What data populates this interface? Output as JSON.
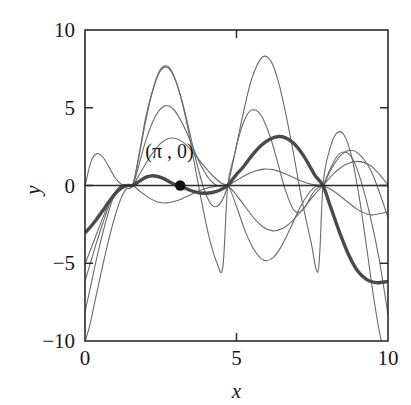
{
  "chart_data": {
    "type": "line",
    "title": "",
    "xlabel": "x",
    "ylabel": "y",
    "xlim": [
      0,
      10
    ],
    "ylim": [
      -10,
      10
    ],
    "grid": false,
    "legend": false,
    "xticks": [
      0,
      5,
      10
    ],
    "xticklabels": [
      "0",
      "5",
      "10"
    ],
    "yticks": [
      -10,
      -5,
      0,
      5,
      10
    ],
    "yticklabels": [
      "−10",
      "−5",
      "0",
      "5",
      "10"
    ],
    "common_nodes_x": [
      1.571,
      4.712,
      7.854
    ],
    "annotations": [
      {
        "text": "(π , 0)",
        "x": 3.1416,
        "y": 0,
        "marker": "filled-circle",
        "label_offset_x": -0.35,
        "label_offset_y": 1.75
      }
    ],
    "series": [
      {
        "name": "curve-1",
        "emphasis": "bold",
        "color": "#4a4a4a",
        "x": [
          0.0,
          0.2,
          0.4,
          0.6,
          0.8,
          1.0,
          1.2,
          1.4,
          1.571,
          1.8,
          2.0,
          2.2,
          2.4,
          2.6,
          2.8,
          3.0,
          3.1416,
          3.4,
          3.6,
          3.8,
          4.0,
          4.2,
          4.4,
          4.6,
          4.712,
          5.0,
          5.2,
          5.5,
          5.8,
          6.1,
          6.4,
          6.6,
          6.8,
          7.0,
          7.2,
          7.4,
          7.6,
          7.854,
          8.1,
          8.4,
          8.7,
          9.0,
          9.3,
          9.6,
          9.8,
          10.0
        ],
        "y": [
          -3.05,
          -2.62,
          -2.12,
          -1.58,
          -1.02,
          -0.52,
          -0.16,
          -0.01,
          0.0,
          0.28,
          0.52,
          0.62,
          0.58,
          0.44,
          0.22,
          0.04,
          -0.03,
          -0.26,
          -0.4,
          -0.48,
          -0.5,
          -0.45,
          -0.34,
          -0.14,
          0.0,
          0.72,
          1.14,
          1.9,
          2.55,
          2.98,
          3.15,
          3.08,
          2.85,
          2.48,
          1.95,
          1.3,
          0.62,
          0.0,
          -1.35,
          -3.0,
          -4.45,
          -5.5,
          -6.05,
          -6.25,
          -6.22,
          -6.18
        ]
      },
      {
        "name": "curve-2",
        "emphasis": "normal",
        "color": "#6b6b6b",
        "x": [
          0.0,
          0.2,
          0.4,
          0.6,
          0.8,
          1.0,
          1.2,
          1.4,
          1.571,
          1.8,
          2.1,
          2.4,
          2.7,
          3.0,
          3.3,
          3.6,
          3.9,
          4.2,
          4.5,
          4.712,
          5.0,
          5.3,
          5.6,
          5.9,
          6.2,
          6.5,
          6.8,
          7.1,
          7.4,
          7.6,
          7.854,
          8.2,
          8.6,
          9.0,
          9.4,
          9.7,
          10.0
        ],
        "y": [
          -0.05,
          1.55,
          2.05,
          1.8,
          1.15,
          0.48,
          0.08,
          -0.02,
          0.0,
          -0.35,
          -0.78,
          -1.06,
          -1.12,
          -1.0,
          -0.76,
          -0.48,
          -0.24,
          -0.09,
          -0.02,
          0.0,
          0.32,
          0.66,
          0.92,
          1.05,
          1.02,
          0.84,
          0.58,
          0.32,
          0.11,
          0.04,
          0.0,
          -0.35,
          -0.95,
          -1.55,
          -1.88,
          -1.82,
          -1.7
        ]
      },
      {
        "name": "curve-3",
        "emphasis": "normal",
        "color": "#6b6b6b",
        "x": [
          0.0,
          0.2,
          0.4,
          0.6,
          0.8,
          1.0,
          1.2,
          1.4,
          1.571,
          1.8,
          2.1,
          2.4,
          2.7,
          3.0,
          3.3,
          3.6,
          3.9,
          4.2,
          4.5,
          4.712,
          5.0,
          5.3,
          5.6,
          5.9,
          6.2,
          6.5,
          6.8,
          7.1,
          7.4,
          7.6,
          7.854,
          8.2,
          8.6,
          9.0,
          9.4,
          9.7,
          10.0
        ],
        "y": [
          -5.05,
          -4.05,
          -3.02,
          -2.02,
          -1.1,
          -0.4,
          -0.02,
          0.05,
          0.0,
          0.72,
          1.7,
          2.52,
          2.98,
          3.02,
          2.68,
          2.05,
          1.32,
          0.66,
          0.15,
          0.0,
          -0.62,
          -1.4,
          -2.15,
          -2.7,
          -2.92,
          -2.78,
          -2.35,
          -1.72,
          -1.0,
          -0.52,
          0.0,
          0.75,
          1.35,
          1.55,
          1.3,
          0.75,
          0.05
        ]
      },
      {
        "name": "curve-4",
        "emphasis": "normal",
        "color": "#6b6b6b",
        "x": [
          0.0,
          0.2,
          0.4,
          0.6,
          0.8,
          1.0,
          1.2,
          1.4,
          1.571,
          1.75,
          2.0,
          2.3,
          2.6,
          2.9,
          3.2,
          3.5,
          3.8,
          4.1,
          4.4,
          4.712,
          5.0,
          5.3,
          5.6,
          5.9,
          6.2,
          6.5,
          6.8,
          7.1,
          7.4,
          7.6,
          7.854,
          8.1,
          8.4,
          8.7,
          9.0,
          9.4,
          9.7,
          10.0
        ],
        "y": [
          -6.15,
          -4.85,
          -3.55,
          -2.35,
          -1.25,
          -0.42,
          -0.02,
          0.06,
          0.0,
          1.1,
          2.85,
          4.35,
          5.1,
          4.95,
          4.05,
          2.75,
          1.4,
          0.42,
          -0.05,
          0.0,
          -1.35,
          -3.0,
          -4.2,
          -4.8,
          -4.65,
          -3.85,
          -2.65,
          -1.4,
          -0.45,
          -0.08,
          0.0,
          0.95,
          1.85,
          2.25,
          2.1,
          1.1,
          -0.35,
          -2.05
        ]
      },
      {
        "name": "curve-5",
        "emphasis": "normal",
        "color": "#6b6b6b",
        "x": [
          0.0,
          0.2,
          0.4,
          0.6,
          0.8,
          1.0,
          1.2,
          1.4,
          1.571,
          1.75,
          2.0,
          2.2,
          2.45,
          2.7,
          2.95,
          3.2,
          3.45,
          3.7,
          3.95,
          4.2,
          4.45,
          4.712,
          5.0,
          5.25,
          5.5,
          5.8,
          6.1,
          6.35,
          6.6,
          6.9,
          7.2,
          7.5,
          7.7,
          7.854,
          8.1,
          8.4,
          8.75,
          9.05,
          9.4,
          9.7,
          10.0
        ],
        "y": [
          -8.15,
          -6.35,
          -4.55,
          -2.95,
          -1.55,
          -0.5,
          -0.02,
          0.08,
          0.0,
          1.55,
          4.1,
          5.85,
          7.25,
          7.6,
          6.95,
          5.45,
          3.45,
          1.35,
          -0.35,
          -1.28,
          -1.18,
          0.0,
          2.55,
          4.15,
          4.85,
          4.55,
          3.2,
          1.55,
          -0.22,
          -1.6,
          -1.55,
          -0.55,
          -0.12,
          0.0,
          1.1,
          2.05,
          1.95,
          0.65,
          -1.85,
          -4.65,
          -8.3
        ]
      },
      {
        "name": "curve-6",
        "emphasis": "normal",
        "color": "#6b6b6b",
        "x": [
          0.0,
          0.15,
          0.35,
          0.55,
          0.75,
          0.95,
          1.15,
          1.35,
          1.571,
          1.78,
          2.0,
          2.25,
          2.5,
          2.8,
          3.1,
          3.35,
          3.6,
          3.85,
          4.1,
          4.35,
          4.55,
          4.712,
          4.95,
          5.2,
          5.5,
          5.85,
          6.15,
          6.4,
          6.65,
          6.9,
          7.15,
          7.45,
          7.7,
          7.854,
          8.05,
          8.3,
          8.55,
          8.8,
          9.05,
          9.3,
          9.5,
          9.7,
          9.9
        ],
        "y": [
          -10.05,
          -9.05,
          -7.25,
          -5.45,
          -3.75,
          -2.25,
          -1.02,
          -0.25,
          0.0,
          1.95,
          4.35,
          6.25,
          7.5,
          7.55,
          6.1,
          4.1,
          1.55,
          -1.05,
          -3.35,
          -4.95,
          -5.25,
          0.0,
          2.1,
          4.45,
          6.85,
          8.25,
          7.95,
          6.55,
          4.4,
          1.85,
          -0.85,
          -3.55,
          -5.45,
          0.0,
          2.15,
          3.35,
          3.25,
          1.85,
          -0.75,
          -4.05,
          -6.85,
          -9.25,
          -11.0
        ]
      }
    ]
  },
  "figure": {
    "background_color": "#ffffff",
    "frame_color": "#2b2b2b",
    "curve_color": "#6b6b6b",
    "bold_curve_color": "#4a4a4a",
    "marker_color": "#111111"
  }
}
